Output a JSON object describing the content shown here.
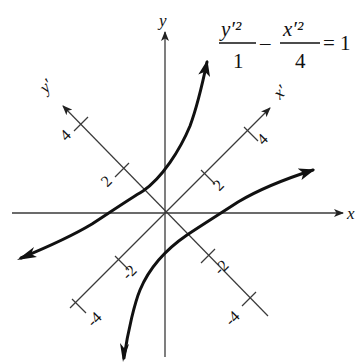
{
  "diagram": {
    "equation": {
      "numerator_left": "y′²",
      "denominator_left": "1",
      "minus": "–",
      "numerator_right": "x′²",
      "denominator_right": "4",
      "equals": "= 1"
    },
    "axes": {
      "x_label": "x",
      "y_label": "y",
      "x_prime_label": "x′",
      "y_prime_label": "y′"
    },
    "ticks": {
      "x_prime": [
        "2",
        "4",
        "-2",
        "-4"
      ],
      "y_prime": [
        "2",
        "4",
        "-2",
        "-4"
      ]
    },
    "colors": {
      "axis": "#3a3a3a",
      "curve": "#111111",
      "background": "#ffffff"
    }
  }
}
